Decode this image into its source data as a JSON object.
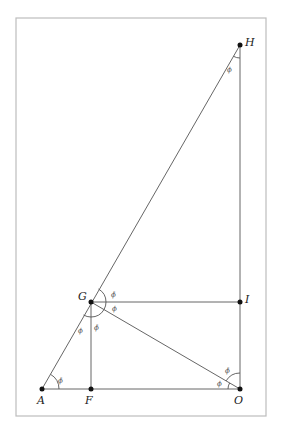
{
  "diagram": {
    "frame": {
      "x": 16,
      "y": 18,
      "w": 250,
      "h": 398,
      "stroke": "#bdbdbd"
    },
    "line_color": "#555555",
    "point_color": "#111111",
    "points": {
      "H": {
        "label": "H",
        "x": 240,
        "y": 45
      },
      "G": {
        "label": "G",
        "x": 91,
        "y": 302
      },
      "I": {
        "label": "I",
        "x": 240,
        "y": 302
      },
      "A": {
        "label": "A",
        "x": 42,
        "y": 389
      },
      "F": {
        "label": "F",
        "x": 91,
        "y": 389
      },
      "O": {
        "label": "O",
        "x": 240,
        "y": 389
      }
    },
    "segments": [
      [
        "A",
        "H"
      ],
      [
        "H",
        "O"
      ],
      [
        "A",
        "O"
      ],
      [
        "G",
        "I"
      ],
      [
        "G",
        "F"
      ],
      [
        "G",
        "O"
      ]
    ],
    "angle_labels": {
      "at_H": "ϕ",
      "at_A": "ϕ̄",
      "at_G_upper": "ϕ̄",
      "at_G_right": "ϕ",
      "at_G_lower_left": "ϕ",
      "at_G_lower": "ϕ̄",
      "at_O_upper": "ϕ̄",
      "at_O_lower": "ϕ"
    }
  }
}
